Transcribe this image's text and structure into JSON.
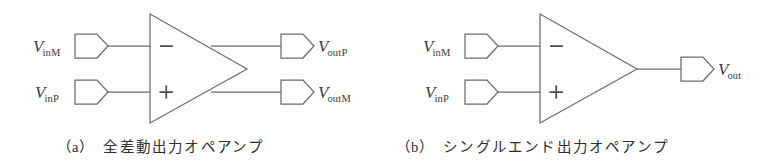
{
  "figure": {
    "background_color": "#fdfdfb",
    "line_color": "#6e6e70",
    "text_color": "#3c3c3e",
    "panels": [
      {
        "id": "a",
        "caption_tag": "（a）",
        "caption_text": "全差動出力オペアンプ",
        "symbol": "operational-amplifier-triangle",
        "inverting_sign": "−",
        "noninverting_sign": "+",
        "inputs": [
          {
            "var": "V",
            "sub": "inM",
            "polarity": "inverting"
          },
          {
            "var": "V",
            "sub": "inP",
            "polarity": "non-inverting"
          }
        ],
        "outputs": [
          {
            "var": "V",
            "sub": "outP"
          },
          {
            "var": "V",
            "sub": "outM"
          }
        ]
      },
      {
        "id": "b",
        "caption_tag": "（b）",
        "caption_text": "シングルエンド出力オペアンプ",
        "symbol": "operational-amplifier-triangle",
        "inverting_sign": "−",
        "noninverting_sign": "+",
        "inputs": [
          {
            "var": "V",
            "sub": "inM",
            "polarity": "inverting"
          },
          {
            "var": "V",
            "sub": "inP",
            "polarity": "non-inverting"
          }
        ],
        "outputs": [
          {
            "var": "V",
            "sub": "out"
          }
        ]
      }
    ]
  }
}
